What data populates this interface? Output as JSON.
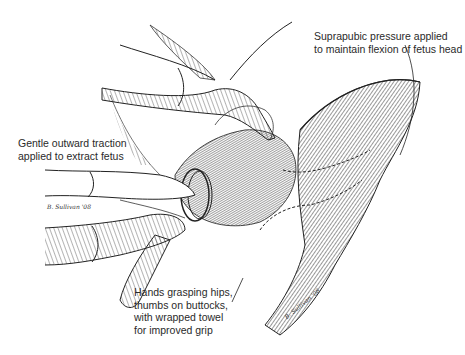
{
  "figure": {
    "style": "pen-and-ink line drawing"
  },
  "annotations": {
    "suprapubic": {
      "lines": [
        "Suprapubic pressure applied",
        "to maintain flexion of fetus head"
      ]
    },
    "traction": {
      "lines": [
        "Gentle outward traction",
        "applied to extract fetus"
      ]
    },
    "hands": {
      "lines": [
        "Hands grasping hips,",
        "thumbs on buttocks,",
        "with wrapped towel",
        "for improved grip"
      ]
    }
  },
  "signatures": {
    "left": "B. Sullivan '08",
    "right": "B. Sullivan '08"
  },
  "colors": {
    "ink": "#2a2a2a",
    "background": "#ffffff"
  }
}
